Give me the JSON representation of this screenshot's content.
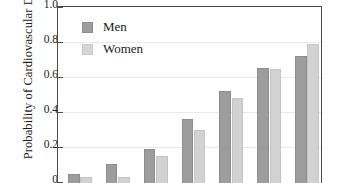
{
  "chart_data": {
    "type": "bar",
    "title": "",
    "xlabel": "",
    "ylabel": "Probability of Cardiovascular Disease",
    "ylim": [
      0,
      1.0
    ],
    "yticks": [
      "1.0",
      "0.8",
      "0.6",
      "0.4",
      "0.2",
      "0"
    ],
    "ytick_values": [
      1.0,
      0.8,
      0.6,
      0.4,
      0.2,
      0
    ],
    "grid": true,
    "legend_position": "upper-left-inside",
    "categories": [
      "1",
      "2",
      "3",
      "4",
      "5",
      "6",
      "7"
    ],
    "series": [
      {
        "name": "Men",
        "color": "#9d9d9d",
        "values": [
          0.04,
          0.095,
          0.185,
          0.355,
          0.515,
          0.645,
          0.715
        ]
      },
      {
        "name": "Women",
        "color": "#d2d2d2",
        "values": [
          0.025,
          0.025,
          0.145,
          0.29,
          0.475,
          0.64,
          0.785
        ]
      }
    ]
  },
  "legend": {
    "items": [
      {
        "label": "Men",
        "swatch": "men-swatch"
      },
      {
        "label": "Women",
        "swatch": "women-swatch"
      }
    ]
  },
  "axis": {
    "y_title": "Probability of Cardiovascular Disease"
  }
}
